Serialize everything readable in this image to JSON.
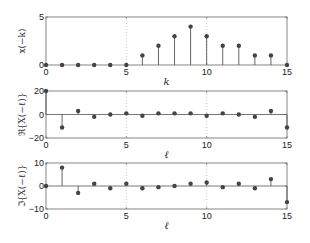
{
  "chart_data": [
    {
      "type": "stem",
      "title": "",
      "xlabel": "k",
      "ylabel": "x(−k)",
      "xlim": [
        0,
        15
      ],
      "ylim": [
        0,
        5
      ],
      "xticks": [
        0,
        5,
        10,
        15
      ],
      "yticks": [
        0,
        5
      ],
      "ytick_labels": [
        "0",
        "5"
      ],
      "grid": "vertical dotted at x=5,10",
      "x": [
        0,
        1,
        2,
        3,
        4,
        5,
        6,
        7,
        8,
        9,
        10,
        11,
        12,
        13,
        14,
        15
      ],
      "values": [
        0,
        0,
        0,
        0,
        0,
        0,
        1,
        2,
        3,
        4,
        3,
        2,
        2,
        1,
        1,
        0
      ]
    },
    {
      "type": "stem",
      "title": "",
      "xlabel": "ℓ",
      "ylabel": "ℜ{X(−ℓ)}",
      "xlim": [
        0,
        15
      ],
      "ylim": [
        -20,
        20
      ],
      "xticks": [
        0,
        5,
        10,
        15
      ],
      "yticks": [
        -20,
        0,
        20
      ],
      "ytick_labels": [
        "−20",
        "0",
        "20"
      ],
      "grid": "vertical dotted at x=5,10",
      "x": [
        0,
        1,
        2,
        3,
        4,
        5,
        6,
        7,
        8,
        9,
        10,
        11,
        12,
        13,
        14,
        15
      ],
      "values": [
        20,
        -11,
        3,
        -2,
        0,
        1,
        -1,
        1,
        1,
        1,
        -1,
        1,
        0,
        -2,
        3,
        -11
      ]
    },
    {
      "type": "stem",
      "title": "",
      "xlabel": "ℓ",
      "ylabel": "ℑ{X(−ℓ)}",
      "xlim": [
        0,
        15
      ],
      "ylim": [
        -10,
        10
      ],
      "xticks": [
        0,
        5,
        10,
        15
      ],
      "yticks": [
        -10,
        0,
        10
      ],
      "ytick_labels": [
        "−10",
        "0",
        "10"
      ],
      "grid": "vertical dotted at x=5,10",
      "x": [
        0,
        1,
        2,
        3,
        4,
        5,
        6,
        7,
        8,
        9,
        10,
        11,
        12,
        13,
        14,
        15
      ],
      "values": [
        0,
        8,
        -3,
        1,
        -1,
        1,
        -1,
        -0.5,
        0,
        1,
        1.5,
        -0.5,
        1,
        -1,
        3,
        -7
      ]
    }
  ],
  "style": {
    "stem_color": "#555555",
    "marker_color": "#444444",
    "axis_color": "#666666",
    "grid_color": "#aaaaaa",
    "background": "#ffffff"
  },
  "layout": {
    "plots": [
      {
        "left": 46,
        "right": 287,
        "top": 17,
        "bottom": 65
      },
      {
        "left": 46,
        "right": 287,
        "top": 91,
        "bottom": 138
      },
      {
        "left": 46,
        "right": 287,
        "top": 163,
        "bottom": 209
      }
    ]
  }
}
